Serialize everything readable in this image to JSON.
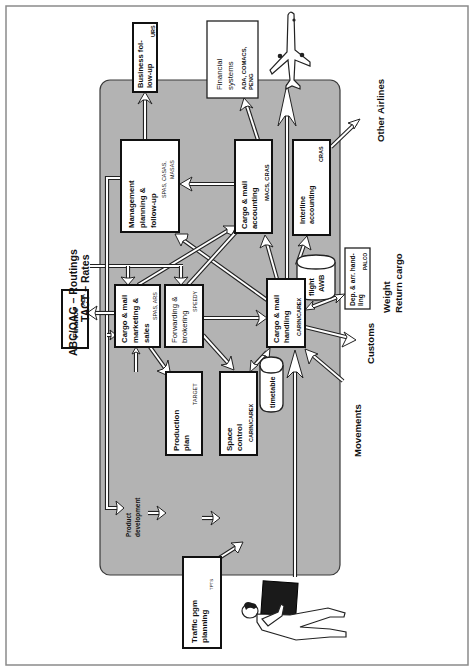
{
  "diagram": {
    "orientation": "rotated-90-ccw",
    "colors": {
      "background": "#ffffff",
      "region_fill": "#b3b3b3",
      "box_fill": "#ffffff",
      "stroke": "#111111"
    },
    "boxes": {
      "business_followup": {
        "lines": [
          "Business fol-",
          "low-up"
        ],
        "system": "URS"
      },
      "financial_systems": {
        "lines": [
          "Financial",
          "systems"
        ],
        "system_lines": [
          "ADA, COMACS,",
          "PENG"
        ]
      },
      "management_planning": {
        "lines": [
          "Management",
          "planning &",
          "follow-up"
        ],
        "system_lines": [
          "SPAS, CASAS,",
          "MASAS"
        ]
      },
      "cargo_mail_accounting": {
        "lines": [
          "Cargo & mail",
          "accounting"
        ],
        "system": "MACS, CRAS"
      },
      "interline_accounting": {
        "lines": [
          "Interline",
          "accounting"
        ],
        "system": "CRAS"
      },
      "finance": {
        "lines": [
          "Finance"
        ],
        "system": "ADA"
      },
      "cargo_mail_marketing": {
        "lines": [
          "Cargo & mail",
          "marketing &",
          "sales"
        ],
        "system": "SPAS, ARS"
      },
      "forwarding_brokering": {
        "lines": [
          "Forwarding &",
          "brokering"
        ],
        "system": "SPEEDY"
      },
      "cargo_mail_handling": {
        "lines": [
          "Cargo & mail",
          "handling"
        ],
        "system": "CARIN/CAREX"
      },
      "dep_arr_handling": {
        "lines": [
          "Dep. & arr. hand-",
          "ling"
        ],
        "system": "PALCO"
      },
      "production_plan": {
        "lines": [
          "Production",
          "plan"
        ],
        "system": "TARGET"
      },
      "space_control": {
        "lines": [
          "Space",
          "control"
        ],
        "system": "CARIN/CAREX"
      },
      "traffic_pgm_planning": {
        "lines": [
          "Traffic pgm",
          "planning"
        ],
        "system": "TPTS"
      }
    },
    "data_stores": {
      "flight_awb": {
        "lines": [
          "flight",
          "AWB"
        ]
      },
      "timetable": {
        "lines": [
          "timetable"
        ]
      }
    },
    "labels": {
      "abc_oag": "ABC/OAG – Routings",
      "tact": "TACT – Rates",
      "other_airlines": "Other Airlines",
      "customs": "Customs",
      "movements": "Movements",
      "weight": "Weight",
      "return_cargo": "Return cargo",
      "product_dev_1": "Product",
      "product_dev_2": "development"
    },
    "icons": {
      "airplane": "airplane-icon",
      "person_with_cargo": "person-carrying-cargo-icon"
    }
  }
}
